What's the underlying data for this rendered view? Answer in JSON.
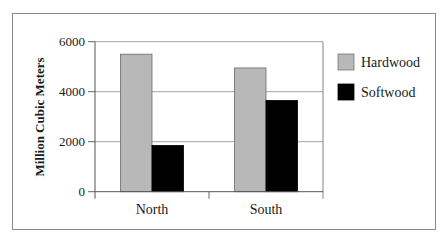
{
  "chart_data": {
    "type": "bar",
    "title": "",
    "xlabel": "",
    "ylabel": "Million Cubic Meters",
    "categories": [
      "North",
      "South"
    ],
    "series": [
      {
        "name": "Hardwood",
        "color": "#b8b8b8",
        "values": [
          5500,
          4950
        ]
      },
      {
        "name": "Softwood",
        "color": "#000000",
        "values": [
          1850,
          3650
        ]
      }
    ],
    "ylim": [
      0,
      6000
    ],
    "yticks": [
      "0",
      "2000",
      "4000",
      "6000"
    ],
    "ytick_values": [
      0,
      2000,
      4000,
      6000
    ],
    "grid": true,
    "legend_position": "right"
  }
}
